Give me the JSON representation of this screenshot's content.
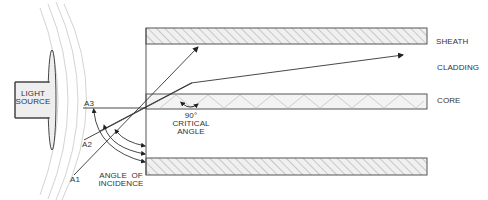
{
  "diagram": {
    "labels": {
      "light_source": [
        "LIGHT",
        "SOURCE"
      ],
      "sheath": "SHEATH",
      "cladding": "CLADDING",
      "core": "CORE",
      "ray_a1": "A1",
      "ray_a2": "A2",
      "ray_a3": "A3",
      "angle_of_incidence": [
        "ANGLE  OF",
        "INCIDENCE"
      ],
      "critical_angle": [
        "90°",
        "CRITICAL",
        "ANGLE"
      ]
    },
    "colors": {
      "line": "#444444",
      "hatch": "#bbbbbb",
      "band_fill": "#eeeeee",
      "source_fill": "#eeeeee",
      "wave": "#cccccc"
    },
    "layers": [
      {
        "name": "sheath",
        "y_top": 28,
        "y_bottom": 44
      },
      {
        "name": "core",
        "y_top": 94,
        "y_bottom": 109
      },
      {
        "name": "sheath-bottom",
        "y_top": 158,
        "y_bottom": 175
      }
    ]
  }
}
